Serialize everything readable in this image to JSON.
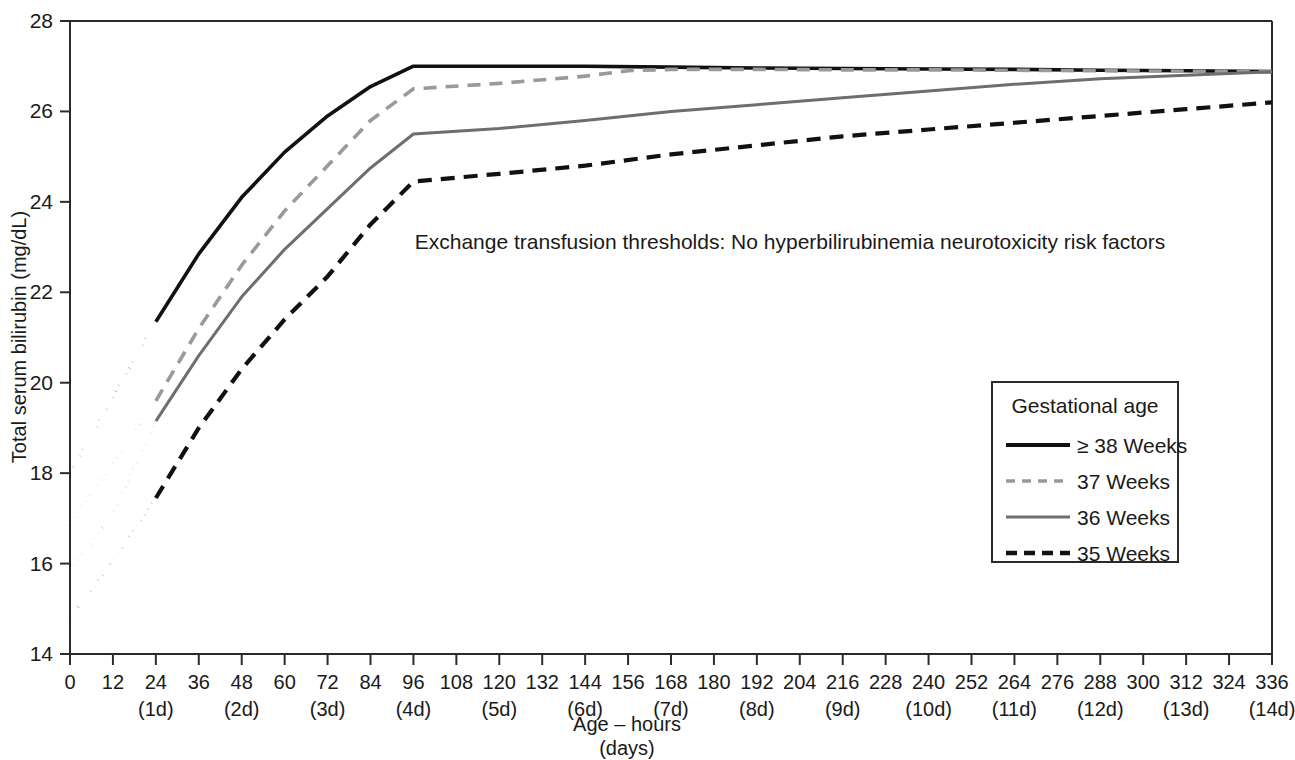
{
  "chart_data": {
    "type": "line",
    "title": "",
    "annotation": "Exchange transfusion thresholds: No hyperbilirubinemia neurotoxicity risk factors",
    "xlabel_line1": "Age – hours",
    "xlabel_line2": "(days)",
    "ylabel": "Total serum bilirubin (mg/dL)",
    "xlim": [
      0,
      336
    ],
    "ylim": [
      14,
      28
    ],
    "grid": false,
    "legend_position": "right-middle",
    "legend_title": "Gestational age",
    "x_tick_hours": [
      0,
      12,
      24,
      36,
      48,
      60,
      72,
      84,
      96,
      108,
      120,
      132,
      144,
      156,
      168,
      180,
      192,
      204,
      216,
      228,
      240,
      252,
      264,
      276,
      288,
      300,
      312,
      324,
      336
    ],
    "x_tick_days": [
      {
        "hour": 24,
        "label": "(1d)"
      },
      {
        "hour": 48,
        "label": "(2d)"
      },
      {
        "hour": 72,
        "label": "(3d)"
      },
      {
        "hour": 96,
        "label": "(4d)"
      },
      {
        "hour": 120,
        "label": "(5d)"
      },
      {
        "hour": 144,
        "label": "(6d)"
      },
      {
        "hour": 168,
        "label": "(7d)"
      },
      {
        "hour": 192,
        "label": "(8d)"
      },
      {
        "hour": 216,
        "label": "(9d)"
      },
      {
        "hour": 240,
        "label": "(10d)"
      },
      {
        "hour": 264,
        "label": "(11d)"
      },
      {
        "hour": 288,
        "label": "(12d)"
      },
      {
        "hour": 312,
        "label": "(13d)"
      },
      {
        "hour": 336,
        "label": "(14d)"
      }
    ],
    "y_tick_values": [
      14,
      16,
      18,
      20,
      22,
      24,
      26,
      28
    ],
    "series": [
      {
        "name": "≥ 38 Weeks",
        "color": "#111111",
        "style": "solid",
        "dotted_head_end_hour": 24,
        "x": [
          0,
          12,
          24,
          36,
          48,
          60,
          72,
          84,
          96,
          120,
          144,
          168,
          192,
          216,
          240,
          264,
          288,
          312,
          336
        ],
        "values": [
          18.0,
          19.7,
          21.35,
          22.85,
          24.1,
          25.1,
          25.9,
          26.55,
          27.0,
          27.0,
          27.0,
          26.98,
          26.96,
          26.95,
          26.94,
          26.93,
          26.91,
          26.9,
          26.88
        ]
      },
      {
        "name": "37 Weeks",
        "color": "#9a9a9a",
        "style": "dashed",
        "dotted_head_end_hour": 24,
        "x": [
          0,
          12,
          24,
          36,
          48,
          60,
          72,
          84,
          96,
          120,
          144,
          156,
          168,
          192,
          216,
          240,
          264,
          288,
          312,
          336
        ],
        "values": [
          16.9,
          18.2,
          19.6,
          21.2,
          22.6,
          23.8,
          24.8,
          25.8,
          26.5,
          26.62,
          26.78,
          26.9,
          26.93,
          26.93,
          26.92,
          26.92,
          26.91,
          26.9,
          26.89,
          26.88
        ]
      },
      {
        "name": "36 Weeks",
        "color": "#6e6e6e",
        "style": "solid",
        "dotted_head_end_hour": 24,
        "x": [
          0,
          12,
          24,
          36,
          48,
          60,
          72,
          84,
          96,
          120,
          144,
          168,
          192,
          216,
          240,
          264,
          288,
          312,
          336
        ],
        "values": [
          15.85,
          17.1,
          19.15,
          20.6,
          21.9,
          22.95,
          23.85,
          24.75,
          25.5,
          25.62,
          25.8,
          26.0,
          26.15,
          26.3,
          26.45,
          26.6,
          26.72,
          26.8,
          26.88
        ]
      },
      {
        "name": "35 Weeks",
        "color": "#111111",
        "style": "dashed",
        "dotted_head_end_hour": 24,
        "x": [
          0,
          12,
          24,
          36,
          48,
          60,
          72,
          84,
          96,
          120,
          144,
          168,
          192,
          216,
          240,
          264,
          288,
          312,
          336
        ],
        "values": [
          14.8,
          16.05,
          17.45,
          19.0,
          20.3,
          21.4,
          22.35,
          23.5,
          24.45,
          24.62,
          24.8,
          25.05,
          25.25,
          25.45,
          25.6,
          25.75,
          25.9,
          26.05,
          26.2
        ]
      }
    ]
  }
}
